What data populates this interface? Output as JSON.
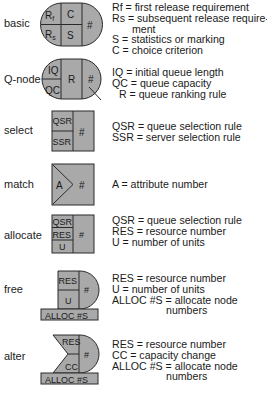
{
  "colors": {
    "fill": "#a9a9a9",
    "stroke": "#2a2a2a",
    "background": "#ffffff"
  },
  "rows": [
    {
      "name": "basic",
      "label": "basic",
      "cells": [
        "Rf",
        "C",
        "Rs",
        "S",
        "#"
      ],
      "definitions": [
        "Rf = first release requirement",
        "Rs = subsequent release require-",
        "ment",
        "S = statistics or marking",
        "C = choice criterion"
      ]
    },
    {
      "name": "q-node",
      "label": "Q-node",
      "cells": [
        "IQ",
        "QC",
        "R",
        "#"
      ],
      "definitions": [
        "IQ = initial queue length",
        "QC = queue capacity",
        "R = queue ranking rule"
      ]
    },
    {
      "name": "select",
      "label": "select",
      "cells": [
        "QSR",
        "SSR",
        "#"
      ],
      "definitions": [
        "QSR = queue selection rule",
        "SSR = server selection rule"
      ]
    },
    {
      "name": "match",
      "label": "match",
      "cells": [
        "A",
        "#"
      ],
      "definitions": [
        "A = attribute number"
      ]
    },
    {
      "name": "allocate",
      "label": "allocate",
      "cells": [
        "QSR",
        "RES",
        "U",
        "#"
      ],
      "definitions": [
        "QSR = queue selection rule",
        "RES = resource number",
        "U = number of units"
      ]
    },
    {
      "name": "free",
      "label": "free",
      "cells": [
        "RES",
        "U",
        "#",
        "ALLOC #S"
      ],
      "definitions": [
        "RES = resource number",
        "U = number of units",
        "ALLOC #S = allocate node",
        "numbers"
      ]
    },
    {
      "name": "alter",
      "label": "alter",
      "cells": [
        "RES",
        "CC",
        "#",
        "ALLOC #S"
      ],
      "definitions": [
        "RES = resource number",
        "CC = capacity change",
        "ALLOC #S = allocate node",
        "numbers"
      ]
    }
  ]
}
